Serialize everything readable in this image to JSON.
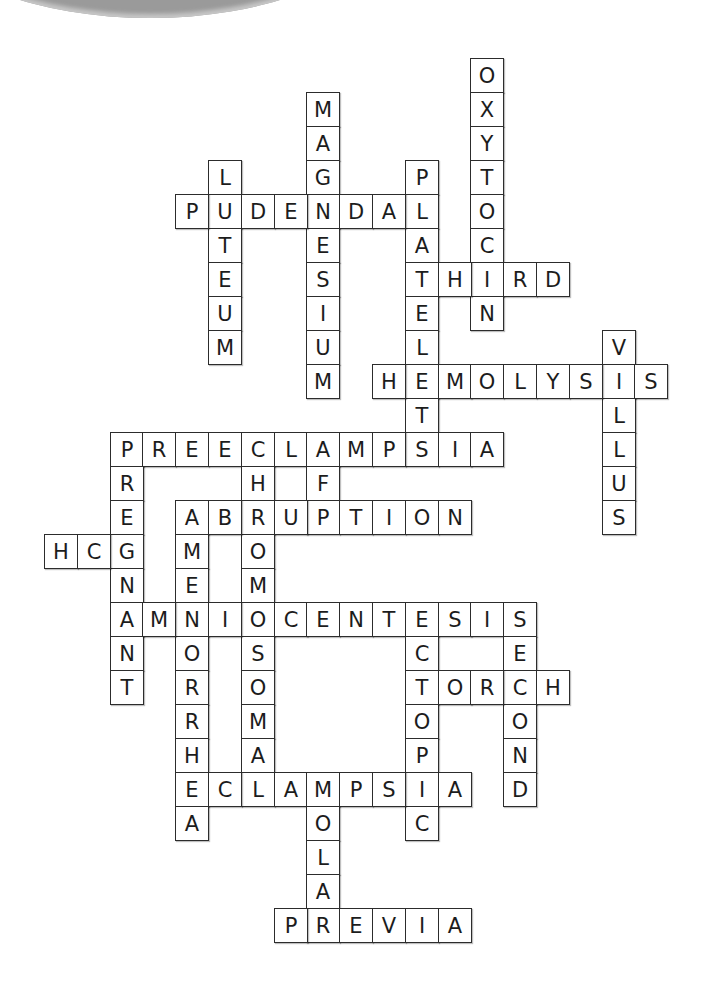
{
  "grid": {
    "origin_x": 44,
    "origin_y": 58,
    "cell_w": 32.8,
    "cell_h": 34
  },
  "decoration": {
    "top_left_arc_color": "#9a9a9a"
  },
  "words": [
    {
      "answer": "OXYTOCIN",
      "direction": "down",
      "row": 0,
      "col": 13
    },
    {
      "answer": "MAGNESIUM",
      "direction": "down",
      "row": 1,
      "col": 8
    },
    {
      "answer": "LUTEUM",
      "direction": "down",
      "row": 3,
      "col": 5
    },
    {
      "answer": "PLATELETS",
      "direction": "down",
      "row": 3,
      "col": 11
    },
    {
      "answer": "PUDENDAL",
      "direction": "across",
      "row": 4,
      "col": 4
    },
    {
      "answer": "THIRD",
      "direction": "across",
      "row": 6,
      "col": 11
    },
    {
      "answer": "VILLUS",
      "direction": "down",
      "row": 8,
      "col": 17
    },
    {
      "answer": "HEMOLYSIS",
      "direction": "across",
      "row": 9,
      "col": 10
    },
    {
      "answer": "PREECLAMPSIA",
      "direction": "across",
      "row": 11,
      "col": 2
    },
    {
      "answer": "PREGNANT",
      "direction": "down",
      "row": 11,
      "col": 2
    },
    {
      "answer": "CHROMOSOMAL",
      "direction": "down",
      "row": 11,
      "col": 6
    },
    {
      "answer": "AFP",
      "direction": "down",
      "row": 11,
      "col": 8
    },
    {
      "answer": "ABRUPTION",
      "direction": "across",
      "row": 13,
      "col": 4
    },
    {
      "answer": "AMENORRHEA",
      "direction": "down",
      "row": 13,
      "col": 4
    },
    {
      "answer": "HCG",
      "direction": "across",
      "row": 14,
      "col": 0
    },
    {
      "answer": "AMNIOCENTESIS",
      "direction": "across",
      "row": 16,
      "col": 2
    },
    {
      "answer": "ECTOPIC",
      "direction": "down",
      "row": 16,
      "col": 11
    },
    {
      "answer": "SECOND",
      "direction": "down",
      "row": 16,
      "col": 14
    },
    {
      "answer": "TORCH",
      "direction": "across",
      "row": 18,
      "col": 11
    },
    {
      "answer": "ECLAMPSIA",
      "direction": "across",
      "row": 21,
      "col": 4
    },
    {
      "answer": "MOLAR",
      "direction": "down",
      "row": 21,
      "col": 8
    },
    {
      "answer": "PREVIA",
      "direction": "across",
      "row": 25,
      "col": 7
    }
  ]
}
